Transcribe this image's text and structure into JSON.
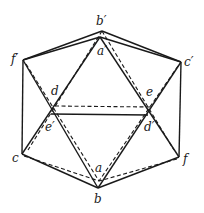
{
  "diagram": {
    "vertices": {
      "b_prime": {
        "label": "b′",
        "x": 102,
        "y": 31
      },
      "a_prime": {
        "label": "a′",
        "x": 100,
        "y": 37
      },
      "f_prime": {
        "label": "f′",
        "x": 23,
        "y": 60
      },
      "c_prime": {
        "label": "c′",
        "x": 181,
        "y": 62
      },
      "d": {
        "label": "d",
        "x": 54,
        "y": 109
      },
      "e": {
        "label": "e",
        "x": 150,
        "y": 110
      },
      "e_prime": {
        "label": "e′",
        "x": 51,
        "y": 114
      },
      "d_prime": {
        "label": "d′",
        "x": 148,
        "y": 115
      },
      "c": {
        "label": "c",
        "x": 22,
        "y": 154
      },
      "f": {
        "label": "f",
        "x": 179,
        "y": 157
      },
      "a": {
        "label": "a",
        "x": 99,
        "y": 181
      },
      "b": {
        "label": "b",
        "x": 98,
        "y": 188
      }
    },
    "labels": {
      "b_prime": "b′",
      "a_prime": "a′",
      "f_prime": "f′",
      "c_prime": "c′",
      "d": "d",
      "e": "e",
      "e_prime": "e′",
      "d_prime": "d′",
      "c": "c",
      "f": "f",
      "a": "a",
      "b": "b"
    },
    "line_color": "#1a1a1a",
    "background": "#ffffff"
  }
}
